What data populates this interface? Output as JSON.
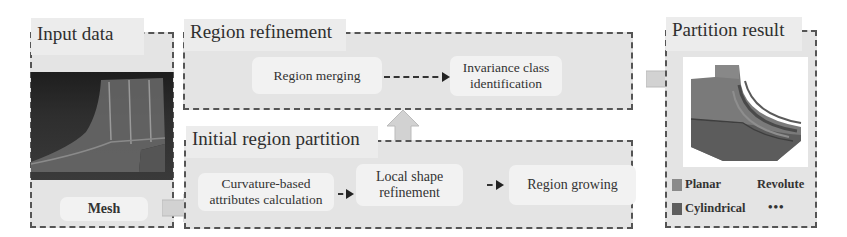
{
  "input_panel": {
    "title": "Input data",
    "node_label": "Mesh",
    "image_desc": "mesh-render"
  },
  "refinement_panel": {
    "title": "Region refinement",
    "nodes": [
      {
        "label": "Region merging"
      },
      {
        "label": "Invariance class identification"
      }
    ]
  },
  "partition_panel": {
    "title": "Initial region partition",
    "nodes": [
      {
        "label": "Curvature-based attributes calculation"
      },
      {
        "label": "Local shape refinement"
      },
      {
        "label": "Region growing"
      }
    ]
  },
  "result_panel": {
    "title": "Partition result",
    "legend": [
      {
        "label": "Planar",
        "color": "#8a8a8a"
      },
      {
        "label": "Revolute",
        "color": ""
      },
      {
        "label": "Cylindrical",
        "color": "#5e5e5e"
      },
      {
        "label": "•••",
        "color": ""
      }
    ]
  },
  "colors": {
    "panel_bg": "#e4e4e4",
    "node_bg": "#f2f2f2",
    "block_arrow": "#d2d2d2",
    "border": "#555555"
  }
}
